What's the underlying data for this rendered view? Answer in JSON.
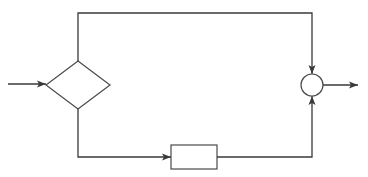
{
  "diagram": {
    "type": "block-diagram",
    "colors": {
      "stroke": "#3a3a3a",
      "fill": "#ffffff",
      "background": "#ffffff"
    },
    "nodes": [
      {
        "id": "input",
        "kind": "input-arrow",
        "label": ""
      },
      {
        "id": "decision",
        "kind": "diamond",
        "label": ""
      },
      {
        "id": "block",
        "kind": "rectangle",
        "label": ""
      },
      {
        "id": "junction",
        "kind": "circle",
        "label": ""
      },
      {
        "id": "output",
        "kind": "output-arrow",
        "label": ""
      }
    ],
    "edges": [
      {
        "from": "input",
        "to": "decision",
        "route": "horizontal"
      },
      {
        "from": "decision",
        "to": "junction",
        "route": "up, right along top, down"
      },
      {
        "from": "decision",
        "to": "block",
        "route": "down, right along bottom"
      },
      {
        "from": "block",
        "to": "junction",
        "route": "right, up"
      },
      {
        "from": "junction",
        "to": "output",
        "route": "horizontal"
      }
    ]
  }
}
